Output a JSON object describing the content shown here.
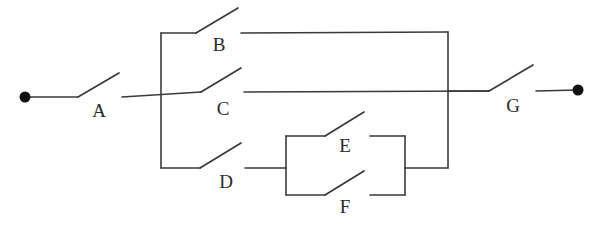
{
  "diagram": {
    "type": "electrical-switch-network",
    "line_color": "#3a3a3a",
    "terminal_color": "#111111",
    "background_color": "#ffffff",
    "stroke_width": 1.6,
    "terminals": [
      {
        "id": "left-terminal",
        "name": "left-terminal",
        "x": 25,
        "y": 97
      },
      {
        "id": "right-terminal",
        "name": "right-terminal",
        "x": 578,
        "y": 90
      }
    ],
    "switches": [
      {
        "id": "A",
        "label": "A",
        "label_x": 99,
        "label_y": 113,
        "state": "open",
        "pivot_x": 78,
        "pivot_y": 97,
        "blade_x": 119,
        "blade_y": 73,
        "lead_in_x": 25,
        "contact_x": 122,
        "contact_y": 97
      },
      {
        "id": "B",
        "label": "B",
        "label_x": 219,
        "label_y": 47,
        "state": "open",
        "pivot_x": 196,
        "pivot_y": 33,
        "blade_x": 238,
        "blade_y": 8,
        "lead_in_x": 161,
        "contact_x": 241,
        "contact_y": 33
      },
      {
        "id": "C",
        "label": "C",
        "label_x": 223,
        "label_y": 111,
        "state": "open",
        "pivot_x": 201,
        "pivot_y": 92,
        "blade_x": 241,
        "blade_y": 68,
        "lead_in_x": 122,
        "contact_x": 244,
        "contact_y": 92
      },
      {
        "id": "D",
        "label": "D",
        "label_x": 226,
        "label_y": 184,
        "state": "open",
        "pivot_x": 200,
        "pivot_y": 168,
        "blade_x": 241,
        "blade_y": 143,
        "lead_in_x": 161,
        "contact_x": 245,
        "contact_y": 168
      },
      {
        "id": "E",
        "label": "E",
        "label_x": 345,
        "label_y": 148,
        "state": "open",
        "pivot_x": 325,
        "pivot_y": 136,
        "blade_x": 364,
        "blade_y": 112,
        "lead_in_x": 286,
        "contact_x": 370,
        "contact_y": 136
      },
      {
        "id": "F",
        "label": "F",
        "label_x": 345,
        "label_y": 209,
        "state": "open",
        "pivot_x": 325,
        "pivot_y": 195,
        "blade_x": 364,
        "blade_y": 171,
        "lead_in_x": 286,
        "contact_x": 370,
        "contact_y": 195
      },
      {
        "id": "G",
        "label": "G",
        "label_x": 513,
        "label_y": 108,
        "state": "open",
        "pivot_x": 489,
        "pivot_y": 91,
        "blade_x": 533,
        "blade_y": 65,
        "lead_in_x": 448,
        "contact_x": 536,
        "contact_y": 91
      }
    ],
    "buses": {
      "left_bus_x": 161,
      "left_bus_top_y": 33,
      "left_bus_bottom_y": 168,
      "right_bus_x": 448,
      "right_bus_top_y": 32,
      "right_bus_bottom_y": 168,
      "main_line_y": 92,
      "ef_box_left_x": 286,
      "ef_box_right_x": 405,
      "ef_box_top_y": 136,
      "ef_box_bottom_y": 195
    },
    "topology_note": "A in series with parallel block (B, C, D+[E parallel F]) in series with G"
  }
}
